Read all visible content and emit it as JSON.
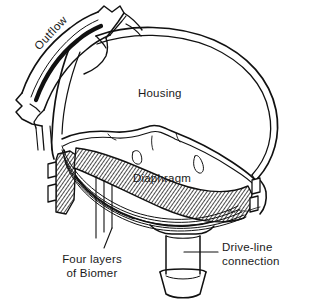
{
  "figure": {
    "kind": "technical-line-drawing",
    "background_color": "#ffffff",
    "ink_color": "#111111",
    "labels": {
      "housing": "Housing",
      "diaphragm": "Diaphragm",
      "outflow": "Outflow",
      "four_layers_line1": "Four layers",
      "four_layers_line2": "of Biomer",
      "drive_line_line1": "Drive-line",
      "drive_line_line2": "connection"
    },
    "parts": [
      {
        "name": "housing",
        "description": "dome-shaped outer shell with double-line wall"
      },
      {
        "name": "outflow-tube",
        "description": "curved tube at upper left with flared cut end"
      },
      {
        "name": "diaphragm",
        "description": "flexible membrane across the interior"
      },
      {
        "name": "layered-edge",
        "description": "four stacked thin layers at the rim"
      },
      {
        "name": "hatched-cross-section",
        "description": "cross-hatched cut wall of the housing rim"
      },
      {
        "name": "drive-line-connection",
        "description": "cylindrical port with flared cuff at the bottom"
      },
      {
        "name": "artist-signature",
        "description": "cursive signature near lower right of diaphragm"
      }
    ]
  }
}
